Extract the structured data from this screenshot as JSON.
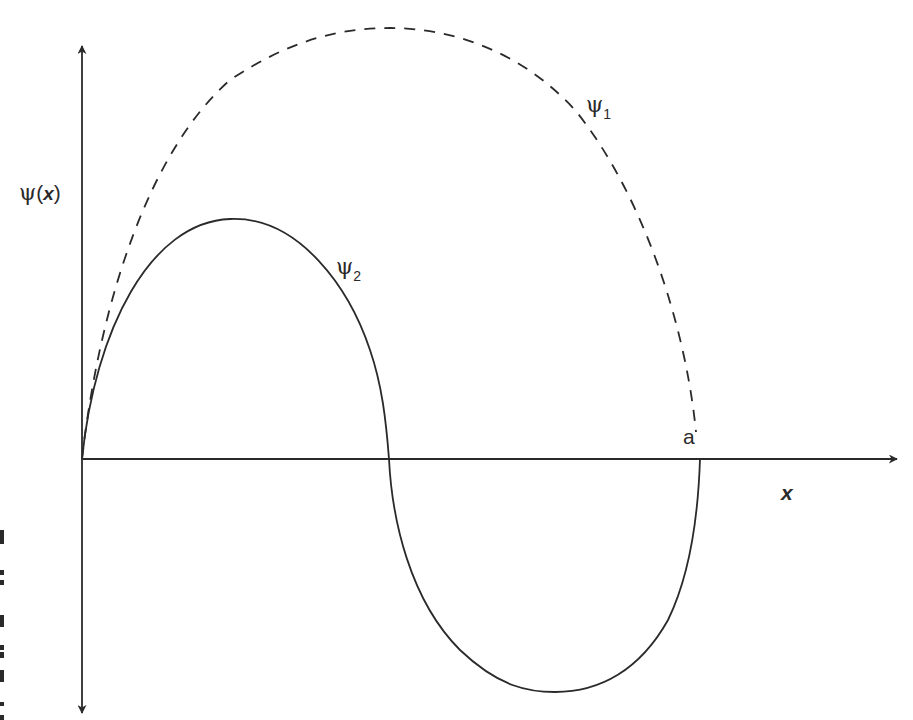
{
  "diagram": {
    "type": "wavefunction-plot",
    "y_axis_label": {
      "symbol": "ψ",
      "open": "(",
      "var": "x",
      "close": ")"
    },
    "x_axis_label": "x",
    "boundary_label": "a",
    "curves": [
      {
        "name": "ψ1",
        "symbol": "ψ",
        "subscript": "1",
        "style": "dashed",
        "description": "ground state, half sine wave from 0 to a"
      },
      {
        "name": "ψ2",
        "symbol": "ψ",
        "subscript": "2",
        "style": "solid",
        "description": "first excited state, full sine wave from 0 to a with node at a/2"
      }
    ],
    "colors": {
      "line": "#2a2a2a",
      "background": "#ffffff"
    }
  }
}
